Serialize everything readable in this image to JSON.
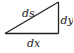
{
  "diagram": {
    "type": "right-triangle",
    "labels": {
      "hypotenuse": "ds",
      "vertical": "dy",
      "horizontal": "dx"
    },
    "colors": {
      "stroke": "#222222",
      "background": "#ffffff"
    }
  }
}
